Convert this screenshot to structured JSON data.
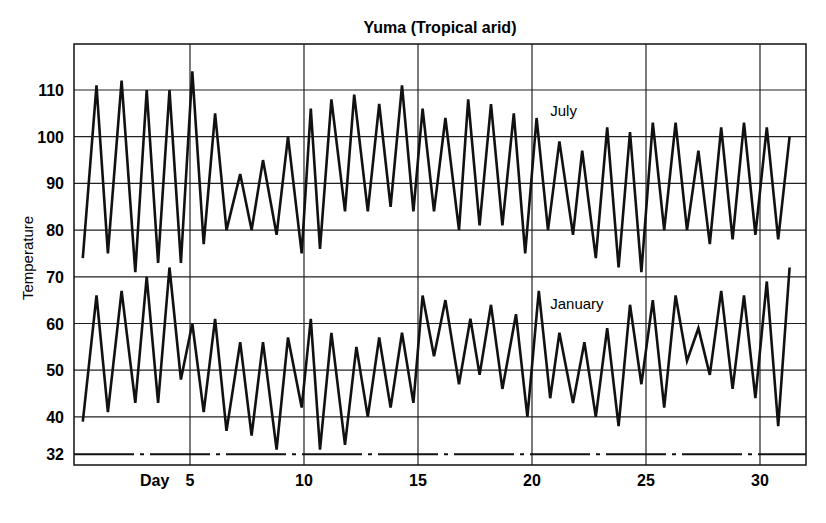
{
  "chart_data": {
    "type": "line",
    "title": "Yuma (Tropical arid)",
    "xlabel": "Day",
    "ylabel": "Temperature",
    "x_ticks": [
      5,
      10,
      15,
      20,
      25,
      30
    ],
    "y_ticks": [
      32,
      40,
      50,
      60,
      70,
      80,
      90,
      100,
      110
    ],
    "xlim": [
      0,
      32
    ],
    "ylim": [
      30,
      117
    ],
    "grid": true,
    "reference_line": {
      "value": 32,
      "style": "dash-dot"
    },
    "series": [
      {
        "name": "July",
        "label_pos": {
          "day": 20.8,
          "temp": 104.5
        },
        "points": [
          [
            0.3,
            74
          ],
          [
            0.9,
            111
          ],
          [
            1.4,
            75
          ],
          [
            2.0,
            112
          ],
          [
            2.6,
            71
          ],
          [
            3.1,
            110
          ],
          [
            3.6,
            73
          ],
          [
            4.1,
            110
          ],
          [
            4.6,
            73
          ],
          [
            5.1,
            114
          ],
          [
            5.6,
            77
          ],
          [
            6.1,
            105
          ],
          [
            6.6,
            80
          ],
          [
            7.2,
            92
          ],
          [
            7.7,
            80
          ],
          [
            8.2,
            95
          ],
          [
            8.8,
            79
          ],
          [
            9.3,
            100
          ],
          [
            9.9,
            75
          ],
          [
            10.3,
            106
          ],
          [
            10.7,
            76
          ],
          [
            11.2,
            108
          ],
          [
            11.8,
            84
          ],
          [
            12.2,
            109
          ],
          [
            12.8,
            84
          ],
          [
            13.3,
            107
          ],
          [
            13.8,
            85
          ],
          [
            14.3,
            111
          ],
          [
            14.8,
            84
          ],
          [
            15.2,
            106
          ],
          [
            15.7,
            84
          ],
          [
            16.2,
            104
          ],
          [
            16.8,
            80
          ],
          [
            17.2,
            108
          ],
          [
            17.7,
            81
          ],
          [
            18.2,
            107
          ],
          [
            18.7,
            81
          ],
          [
            19.2,
            105
          ],
          [
            19.7,
            75
          ],
          [
            20.2,
            104
          ],
          [
            20.7,
            80
          ],
          [
            21.2,
            99
          ],
          [
            21.8,
            79
          ],
          [
            22.2,
            97
          ],
          [
            22.8,
            74
          ],
          [
            23.3,
            102
          ],
          [
            23.8,
            72
          ],
          [
            24.3,
            101
          ],
          [
            24.8,
            71
          ],
          [
            25.3,
            103
          ],
          [
            25.8,
            80
          ],
          [
            26.3,
            103
          ],
          [
            26.8,
            80
          ],
          [
            27.3,
            97
          ],
          [
            27.8,
            77
          ],
          [
            28.3,
            102
          ],
          [
            28.8,
            78
          ],
          [
            29.3,
            103
          ],
          [
            29.8,
            79
          ],
          [
            30.3,
            102
          ],
          [
            30.8,
            78
          ],
          [
            31.3,
            100
          ]
        ]
      },
      {
        "name": "January",
        "label_pos": {
          "day": 20.8,
          "temp": 63
        },
        "points": [
          [
            0.3,
            39
          ],
          [
            0.9,
            66
          ],
          [
            1.4,
            41
          ],
          [
            2.0,
            67
          ],
          [
            2.6,
            43
          ],
          [
            3.1,
            70
          ],
          [
            3.6,
            43
          ],
          [
            4.1,
            72
          ],
          [
            4.6,
            48
          ],
          [
            5.1,
            60
          ],
          [
            5.6,
            41
          ],
          [
            6.1,
            61
          ],
          [
            6.6,
            37
          ],
          [
            7.2,
            56
          ],
          [
            7.7,
            36
          ],
          [
            8.2,
            56
          ],
          [
            8.8,
            33
          ],
          [
            9.3,
            57
          ],
          [
            9.9,
            42
          ],
          [
            10.3,
            61
          ],
          [
            10.7,
            33
          ],
          [
            11.2,
            58
          ],
          [
            11.8,
            34
          ],
          [
            12.3,
            55
          ],
          [
            12.8,
            40
          ],
          [
            13.3,
            57
          ],
          [
            13.8,
            42
          ],
          [
            14.3,
            58
          ],
          [
            14.8,
            43
          ],
          [
            15.2,
            66
          ],
          [
            15.7,
            53
          ],
          [
            16.2,
            65
          ],
          [
            16.8,
            47
          ],
          [
            17.3,
            61
          ],
          [
            17.7,
            49
          ],
          [
            18.2,
            64
          ],
          [
            18.7,
            46
          ],
          [
            19.3,
            62
          ],
          [
            19.8,
            40
          ],
          [
            20.3,
            67
          ],
          [
            20.8,
            44
          ],
          [
            21.2,
            58
          ],
          [
            21.8,
            43
          ],
          [
            22.3,
            56
          ],
          [
            22.8,
            40
          ],
          [
            23.3,
            59
          ],
          [
            23.8,
            38
          ],
          [
            24.3,
            64
          ],
          [
            24.8,
            47
          ],
          [
            25.3,
            65
          ],
          [
            25.8,
            42
          ],
          [
            26.3,
            66
          ],
          [
            26.8,
            52
          ],
          [
            27.3,
            59
          ],
          [
            27.8,
            49
          ],
          [
            28.3,
            67
          ],
          [
            28.8,
            46
          ],
          [
            29.3,
            66
          ],
          [
            29.8,
            44
          ],
          [
            30.3,
            69
          ],
          [
            30.8,
            38
          ],
          [
            31.3,
            72
          ]
        ]
      }
    ]
  },
  "labels": {
    "title": "Yuma (Tropical arid)",
    "ylabel": "Temperature",
    "xlabel": "Day",
    "july": "July",
    "january": "January"
  },
  "colors": {
    "line": "#111111",
    "grid": "#222222",
    "background": "#ffffff"
  }
}
